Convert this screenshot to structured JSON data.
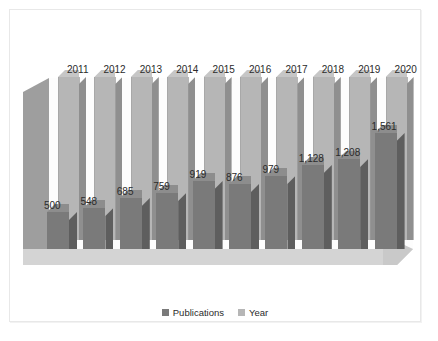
{
  "chart_data": {
    "type": "bar",
    "title": "",
    "subtitle": "",
    "xlabel": "",
    "ylabel": "",
    "grid": false,
    "legend_position": "bottom",
    "three_d": true,
    "categories": [
      "2011",
      "2012",
      "2013",
      "2014",
      "2015",
      "2016",
      "2017",
      "2018",
      "2019",
      "2020"
    ],
    "series": [
      {
        "name": "Publications",
        "color": "#7a7a7a",
        "values": [
          500,
          548,
          685,
          759,
          919,
          876,
          979,
          1128,
          1208,
          1561
        ],
        "value_labels": [
          "500",
          "548",
          "685",
          "759",
          "919",
          "876",
          "979",
          "1,128",
          "1,208",
          "1,561"
        ]
      },
      {
        "name": "Year",
        "color": "#b6b6b6",
        "values": [
          2011,
          2012,
          2013,
          2014,
          2015,
          2016,
          2017,
          2018,
          2019,
          2020
        ],
        "value_labels": [
          "2011",
          "2012",
          "2013",
          "2014",
          "2015",
          "2016",
          "2017",
          "2018",
          "2019",
          "2020"
        ]
      }
    ],
    "ylim": [
      0,
      2100
    ],
    "legend": [
      "Publications",
      "Year"
    ]
  },
  "legend": {
    "publications_label": "Publications",
    "year_label": "Year"
  },
  "colors": {
    "publications": "#7a7a7a",
    "publications_side": "#5e5e5e",
    "year": "#b6b6b6",
    "year_side": "#8f8f8f",
    "floor": "#d4d4d4",
    "wall": "#9e9e9e",
    "background": "#ffffff",
    "border": "#e8e8e8"
  }
}
